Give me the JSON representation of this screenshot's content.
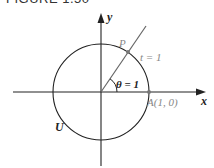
{
  "figure": {
    "title": "FIGURE 1.50"
  },
  "diagram": {
    "axes": {
      "x_label": "x",
      "y_label": "y"
    },
    "circle_label": "U",
    "point_p_label": "P",
    "arc_label": "t = 1",
    "angle_label": "θ = 1",
    "point_a_label": "A(1, 0)",
    "colors": {
      "line": "#222222",
      "ray": "#666666",
      "label_gray": "#888888",
      "point": "#777777"
    }
  }
}
